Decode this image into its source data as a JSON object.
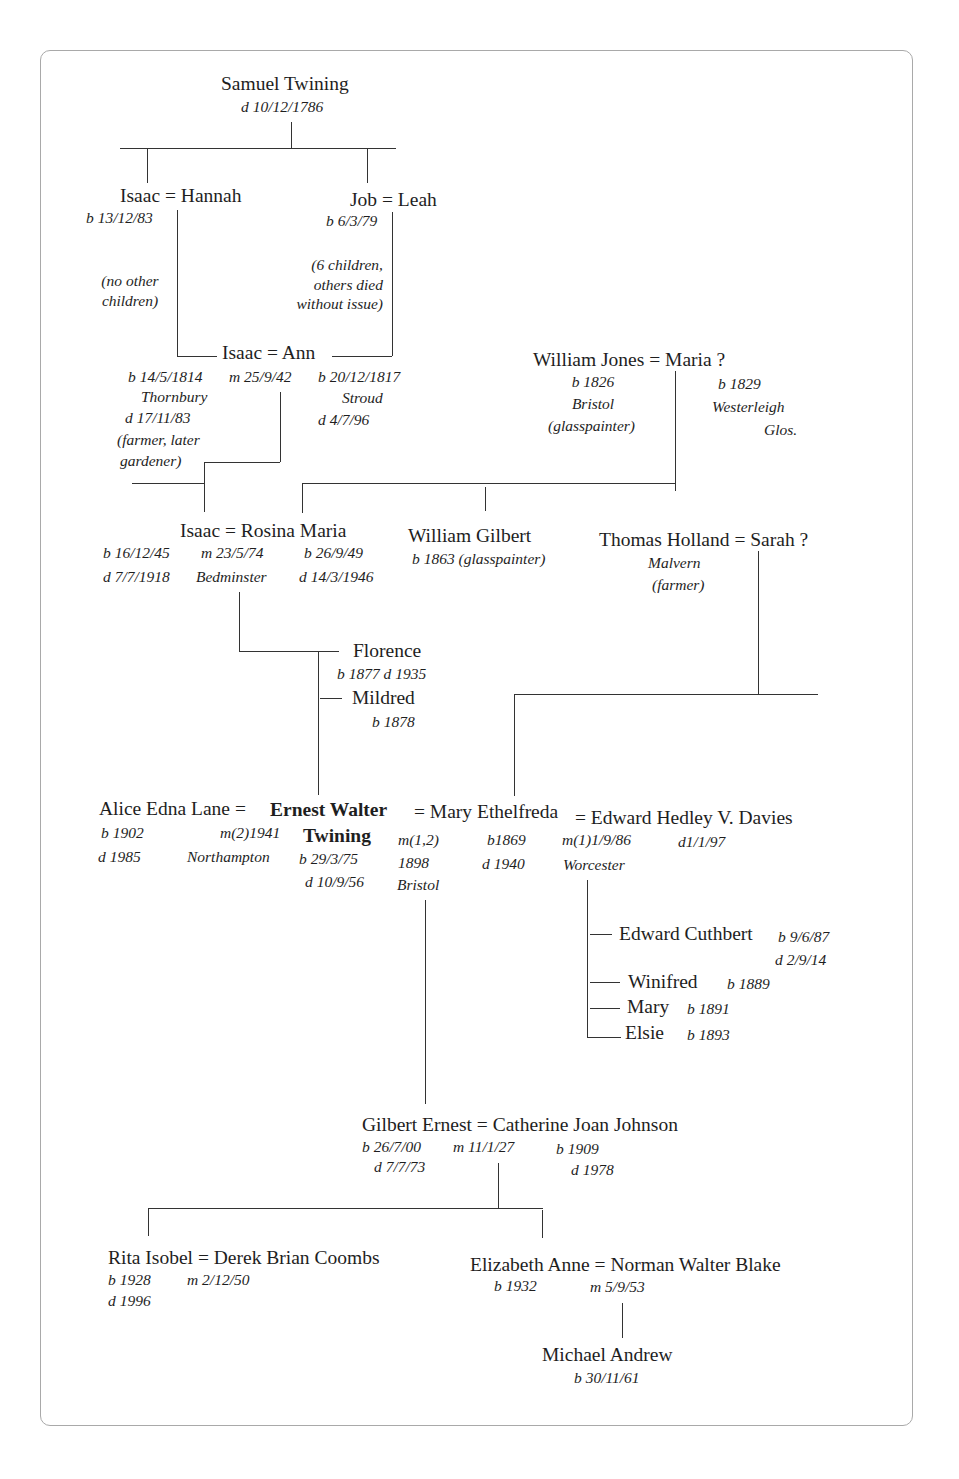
{
  "samuel": {
    "name": "Samuel Twining",
    "d": "d 10/12/1786"
  },
  "gen1": {
    "isaac_hannah": {
      "couple": "Isaac = Hannah",
      "isaac_b": "b 13/12/83",
      "note": [
        "(no other",
        "children)"
      ]
    },
    "job_leah": {
      "couple": "Job = Leah",
      "job_b": "b 6/3/79",
      "note": [
        "(6 children,",
        "others died",
        "without issue)"
      ]
    }
  },
  "gen2": {
    "couple": "Isaac = Ann",
    "isaac": [
      "b 14/5/1814",
      "Thornbury",
      "d 17/11/83",
      "(farmer, later",
      "gardener)"
    ],
    "marriage": "m 25/9/42",
    "ann": [
      "b 20/12/1817",
      "Stroud",
      "d 4/7/96"
    ]
  },
  "jones": {
    "couple": "William Jones = Maria ?",
    "william": [
      "b 1826",
      "Bristol",
      "(glasspainter)"
    ],
    "maria": [
      "b 1829",
      "Westerleigh",
      "Glos."
    ]
  },
  "gen3": {
    "couple": "Isaac = Rosina Maria",
    "isaac": [
      "b 16/12/45",
      "d 7/7/1918"
    ],
    "marriage": [
      "m 23/5/74",
      "Bedminster"
    ],
    "rosina": [
      "b 26/9/49",
      "d 14/3/1946"
    ],
    "william_gilbert": {
      "name": "William Gilbert",
      "info": "b 1863 (glasspainter)"
    }
  },
  "holland": {
    "couple": "Thomas Holland = Sarah ?",
    "thomas": [
      "Malvern",
      "(farmer)"
    ]
  },
  "sisters": [
    {
      "name": "Florence",
      "info": "b 1877  d 1935"
    },
    {
      "name": "Mildred",
      "info": "b 1878"
    }
  ],
  "gen4": {
    "alice": {
      "name": "Alice Edna Lane =",
      "b": "b 1902",
      "d": "d 1985"
    },
    "m2": [
      "m(2)1941",
      "Northampton"
    ],
    "ernest": {
      "name1": "Ernest Walter",
      "name2": "Twining",
      "b": "b 29/3/75",
      "d": "d 10/9/56"
    },
    "m12": [
      "m(1,2)",
      "1898",
      "Bristol"
    ],
    "mary": {
      "name": "= Mary Ethelfreda",
      "b": "b1869",
      "d": "d 1940"
    },
    "m1": [
      "m(1)1/9/86",
      "Worcester"
    ],
    "edward": {
      "name": "= Edward Hedley V. Davies",
      "d": "d1/1/97"
    }
  },
  "davies_children": [
    {
      "name": "Edward Cuthbert",
      "b": "b 9/6/87",
      "d": "d 2/9/14"
    },
    {
      "name": "Winifred",
      "b": "b  1889"
    },
    {
      "name": "Mary",
      "b": "b 1891"
    },
    {
      "name": "Elsie",
      "b": "b 1893"
    }
  ],
  "gen5": {
    "couple": "Gilbert Ernest = Catherine Joan Johnson",
    "gilbert": [
      "b 26/7/00",
      "d 7/7/73"
    ],
    "marriage": "m 11/1/27",
    "catherine": [
      "b 1909",
      "d 1978"
    ]
  },
  "gen6": {
    "rita": {
      "couple": "Rita Isobel = Derek Brian Coombs",
      "b": "b 1928",
      "d": "d 1996",
      "m": "m 2/12/50"
    },
    "elizabeth": {
      "couple": "Elizabeth Anne = Norman Walter Blake",
      "b": "b 1932",
      "m": "m 5/9/53"
    }
  },
  "gen7": {
    "name": "Michael Andrew",
    "b": "b 30/11/61"
  }
}
